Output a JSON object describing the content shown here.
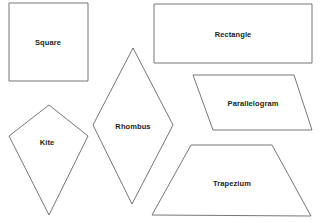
{
  "diagram": {
    "stroke_color": "#666666",
    "shapes": [
      {
        "id": "square",
        "label": "Square",
        "points": "9,3 88,3 88,81 9,81",
        "label_pos": [
          48,
          42
        ]
      },
      {
        "id": "rectangle",
        "label": "Rectangle",
        "points": "154,4 312,4 312,63 154,63",
        "label_pos": [
          233,
          34
        ]
      },
      {
        "id": "parallelogram",
        "label": "Parallelogram",
        "points": "193,75 294,75 312,130 213,130",
        "label_pos": [
          253,
          103
        ]
      },
      {
        "id": "rhombus",
        "label": "Rhombus",
        "points": "133,48 173,125 132,204 93,125",
        "label_pos": [
          133,
          126
        ]
      },
      {
        "id": "kite",
        "label": "Kite",
        "points": "49,105 88,136 49,215 9,136",
        "label_pos": [
          47,
          142
        ]
      },
      {
        "id": "trapezium",
        "label": "Trapezium",
        "points": "191,145 272,145 311,216 152,215",
        "label_pos": [
          232,
          183
        ]
      }
    ]
  }
}
